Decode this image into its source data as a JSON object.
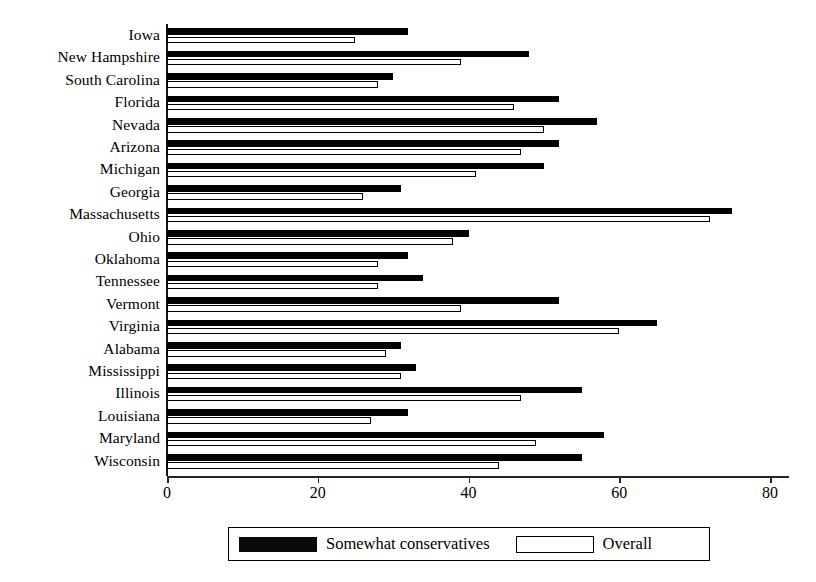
{
  "chart_data": {
    "type": "bar",
    "orientation": "horizontal",
    "title": "",
    "xlabel": "",
    "ylabel": "",
    "xlim": [
      0,
      80
    ],
    "xticks": [
      0,
      20,
      40,
      60,
      80
    ],
    "grid": false,
    "legend_position": "bottom",
    "categories": [
      "Iowa",
      "New Hampshire",
      "South Carolina",
      "Florida",
      "Nevada",
      "Arizona",
      "Michigan",
      "Georgia",
      "Massachusetts",
      "Ohio",
      "Oklahoma",
      "Tennessee",
      "Vermont",
      "Virginia",
      "Alabama",
      "Mississippi",
      "Illinois",
      "Louisiana",
      "Maryland",
      "Wisconsin"
    ],
    "series": [
      {
        "name": "Somewhat conservatives",
        "color": "#000000",
        "style": "filled",
        "values": [
          32,
          48,
          30,
          52,
          57,
          52,
          50,
          31,
          75,
          40,
          32,
          34,
          52,
          65,
          31,
          33,
          55,
          32,
          58,
          55
        ]
      },
      {
        "name": "Overall",
        "color": "#ffffff",
        "style": "outlined",
        "values": [
          25,
          39,
          28,
          46,
          50,
          47,
          41,
          26,
          72,
          38,
          28,
          28,
          39,
          60,
          29,
          31,
          47,
          27,
          49,
          44
        ]
      }
    ]
  },
  "legend": {
    "items": [
      {
        "label": "Somewhat conservatives",
        "swatch": "filled-black"
      },
      {
        "label": "Overall",
        "swatch": "outlined-white"
      }
    ]
  },
  "axis": {
    "tick_labels": [
      "0",
      "20",
      "40",
      "60",
      "80"
    ]
  }
}
